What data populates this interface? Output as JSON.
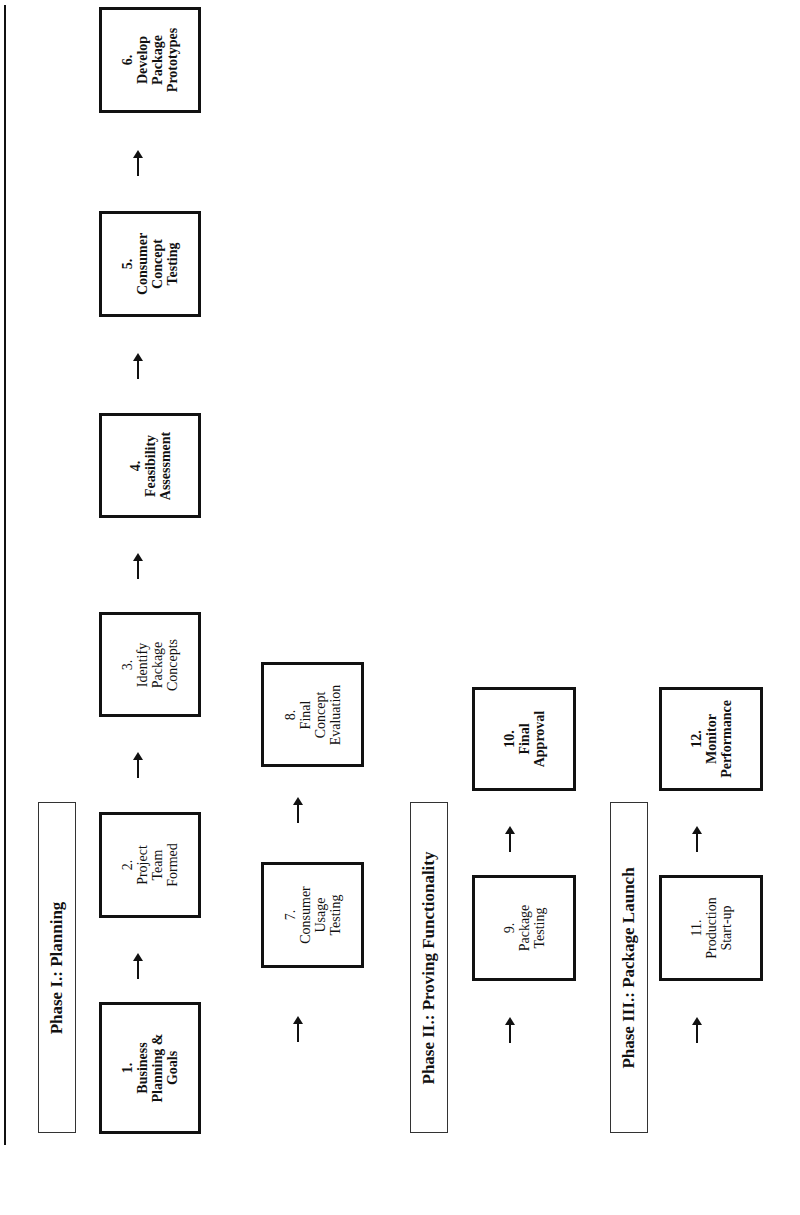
{
  "orientation": "rotated -90deg (landscape page)",
  "phases": [
    {
      "id": "phase1",
      "label": "Phase I.:  Planning"
    },
    {
      "id": "phase2",
      "label": "Phase II.: Proving Functionality"
    },
    {
      "id": "phase3",
      "label": "Phase III.: Package Launch"
    }
  ],
  "steps": [
    {
      "num": "1.",
      "lines": [
        "Business",
        "Planning &",
        "Goals"
      ],
      "phase": "Phase I"
    },
    {
      "num": "2.",
      "lines": [
        "Project",
        "Team",
        "Formed"
      ],
      "phase": "Phase I"
    },
    {
      "num": "3.",
      "lines": [
        "Identify",
        "Package",
        "Concepts"
      ],
      "phase": "Phase I"
    },
    {
      "num": "4.",
      "lines": [
        "Feasibility",
        "Assessment"
      ],
      "phase": "Phase I"
    },
    {
      "num": "5.",
      "lines": [
        "Consumer",
        "Concept",
        "Testing"
      ],
      "phase": "Phase I"
    },
    {
      "num": "6.",
      "lines": [
        "Develop",
        "Package",
        "Prototypes"
      ],
      "phase": "Phase I"
    },
    {
      "num": "7.",
      "lines": [
        "Consumer",
        "Usage",
        "Testing"
      ],
      "phase": "Phase I"
    },
    {
      "num": "8.",
      "lines": [
        "Final",
        "Concept",
        "Evaluation"
      ],
      "phase": "Phase I"
    },
    {
      "num": "9.",
      "lines": [
        "Package",
        "Testing"
      ],
      "phase": "Phase II"
    },
    {
      "num": "10.",
      "lines": [
        "Final",
        "Approval"
      ],
      "phase": "Phase II"
    },
    {
      "num": "11.",
      "lines": [
        "Production",
        "Start-up"
      ],
      "phase": "Phase III"
    },
    {
      "num": "12.",
      "lines": [
        "Monitor",
        "Performance"
      ],
      "phase": "Phase III"
    }
  ],
  "flow": [
    [
      "1.",
      "2."
    ],
    [
      "2.",
      "3."
    ],
    [
      "3.",
      "4."
    ],
    [
      "4.",
      "5."
    ],
    [
      "5.",
      "6."
    ],
    [
      "6.",
      "7."
    ],
    [
      "7.",
      "8."
    ],
    [
      "8.",
      "9."
    ],
    [
      "9.",
      "10."
    ],
    [
      "10.",
      "11."
    ],
    [
      "11.",
      "12."
    ]
  ],
  "colors": {
    "line": "#111111",
    "background": "#ffffff"
  }
}
